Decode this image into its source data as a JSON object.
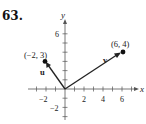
{
  "problem": {
    "number": "63."
  },
  "axes": {
    "x_label": "x",
    "y_label": "y",
    "x_ticks": [
      "−2",
      "2",
      "4",
      "6"
    ],
    "y_ticks": [
      "6",
      "−2"
    ]
  },
  "vectors": [
    {
      "name": "u",
      "label": "u",
      "tail": [
        0,
        0
      ],
      "head": [
        -2,
        3
      ],
      "point_label": "(−2, 3)"
    },
    {
      "name": "v",
      "label": "v",
      "tail": [
        0,
        0
      ],
      "head": [
        6,
        4
      ],
      "point_label": "(6, 4)"
    }
  ],
  "colors": {
    "ink": "#222222",
    "background": "#ffffff"
  }
}
